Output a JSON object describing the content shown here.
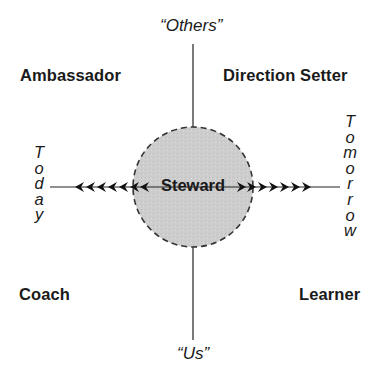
{
  "diagram": {
    "center": {
      "label": "Steward",
      "fill": "#cfcfcf",
      "border": "#3a3a3a"
    },
    "vertical_axis": {
      "top_label": "“Others”",
      "bottom_label": "“Us”"
    },
    "horizontal_axis": {
      "left_label": "Today",
      "left_letters": [
        "T",
        "o",
        "d",
        "a",
        "y"
      ],
      "right_label": "Tomorrow",
      "right_letters": [
        "T",
        "o",
        "m",
        "o",
        "r",
        "r",
        "o",
        "w"
      ],
      "left_arrowheads": 7,
      "right_arrowheads": 7
    },
    "quadrants": {
      "top_left": "Ambassador",
      "top_right": "Direction Setter",
      "bottom_left": "Coach",
      "bottom_right": "Learner"
    }
  }
}
